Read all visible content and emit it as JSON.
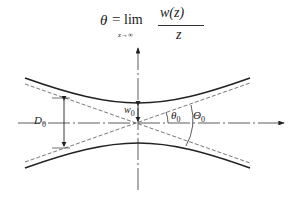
{
  "formula": {
    "lhs": "θ",
    "equals": "=",
    "operator": "lim",
    "limit_subscript": "z→∞",
    "numerator": "w(z)",
    "denominator": "z"
  },
  "labels": {
    "D0": {
      "main": "D",
      "sub": "0"
    },
    "w0": {
      "main": "w",
      "sub": "0"
    },
    "theta0": {
      "main": "θ",
      "sub": "0"
    },
    "Theta0": {
      "main": "Θ",
      "sub": "0"
    }
  },
  "colors": {
    "line": "#222222",
    "dashed": "#555555",
    "background": "#ffffff"
  }
}
